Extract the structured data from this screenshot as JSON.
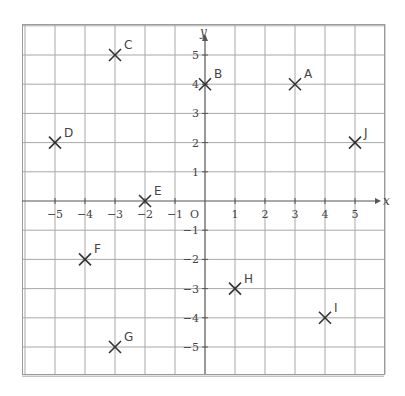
{
  "chart_data": {
    "type": "scatter",
    "title": "",
    "xlabel": "x",
    "ylabel": "y",
    "origin_label": "O",
    "xlim": [
      -6,
      6
    ],
    "ylim": [
      -6,
      6
    ],
    "grid": true,
    "x_ticks": [
      -5,
      -4,
      -3,
      -2,
      -1,
      1,
      2,
      3,
      4,
      5
    ],
    "y_ticks": [
      5,
      4,
      3,
      2,
      1,
      -1,
      -2,
      -3,
      -4,
      -5
    ],
    "x_tick_labels": [
      "−5",
      "−4",
      "−3",
      "−2",
      "−1",
      "1",
      "2",
      "3",
      "4",
      "5"
    ],
    "y_tick_labels": [
      "5",
      "4",
      "3",
      "2",
      "1",
      "−1",
      "−2",
      "−3",
      "−4",
      "−5"
    ],
    "marker": "x",
    "points": [
      {
        "label": "A",
        "x": 3,
        "y": 4
      },
      {
        "label": "B",
        "x": 0,
        "y": 4
      },
      {
        "label": "C",
        "x": -3,
        "y": 5
      },
      {
        "label": "D",
        "x": -5,
        "y": 2
      },
      {
        "label": "E",
        "x": -2,
        "y": 0
      },
      {
        "label": "F",
        "x": -4,
        "y": -2
      },
      {
        "label": "G",
        "x": -3,
        "y": -5
      },
      {
        "label": "H",
        "x": 1,
        "y": -3
      },
      {
        "label": "I",
        "x": 4,
        "y": -4
      },
      {
        "label": "J",
        "x": 5,
        "y": 2
      }
    ]
  },
  "colors": {
    "grid": "#a8a8a8",
    "axis": "#555555",
    "marker": "#333333",
    "text": "#444444"
  }
}
